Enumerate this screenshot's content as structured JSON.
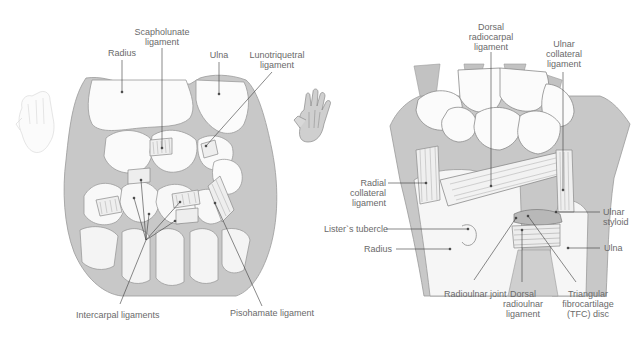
{
  "colors": {
    "background": "#ffffff",
    "bone_fill": "#fbfbfb",
    "bone_stroke": "#9a9a9a",
    "shadow": "#c4c4c4",
    "deep_shadow": "#b3b3b3",
    "ligament_fill": "#eeeeee",
    "leader_line": "#3a3a3a",
    "label_text": "#6a6a6a"
  },
  "left_view": {
    "orientation": "palmar",
    "thumbnail_icon": "palm-hand-icon",
    "labels": {
      "radius": "Radius",
      "scapholunate_1": "Scapholunate",
      "scapholunate_2": "ligament",
      "ulna": "Ulna",
      "lunotriquetral_1": "Lunotriquetral",
      "lunotriquetral_2": "ligament",
      "intercarpal": "Intercarpal ligaments",
      "pisohamate": "Pisohamate ligament"
    }
  },
  "right_view": {
    "orientation": "dorsal",
    "thumbnail_icon": "back-of-hand-icon",
    "labels": {
      "dorsal_radiocarpal_1": "Dorsal",
      "dorsal_radiocarpal_2": "radiocarpal",
      "dorsal_radiocarpal_3": "ligament",
      "ulnar_collateral_1": "Ulnar",
      "ulnar_collateral_2": "collateral",
      "ulnar_collateral_3": "ligament",
      "radial_collateral_1": "Radial",
      "radial_collateral_2": "collateral",
      "radial_collateral_3": "ligament",
      "listers_tubercle": "Lister`s tubercle",
      "radius": "Radius",
      "ulnar_styloid_1": "Ulnar",
      "ulnar_styloid_2": "styloid",
      "ulna": "Ulna",
      "radioulnar_joint": "Radioulnar joint",
      "dorsal_radioulnar_1": "Dorsal",
      "dorsal_radioulnar_2": "radioulnar",
      "dorsal_radioulnar_3": "ligament",
      "tfc_1": "Triangular",
      "tfc_2": "fibrocartilage",
      "tfc_3": "(TFC) disc"
    }
  }
}
